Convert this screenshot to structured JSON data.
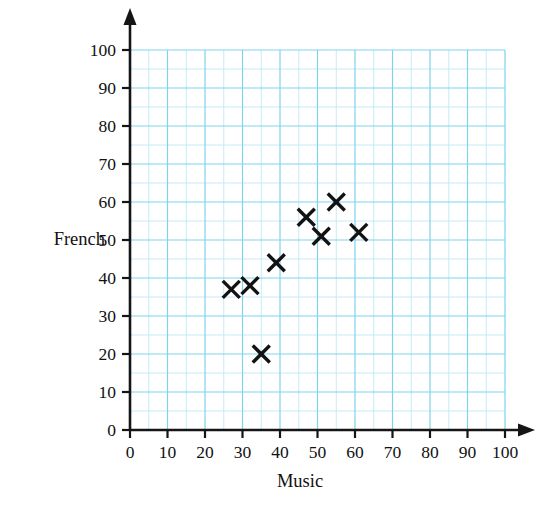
{
  "chart_data": {
    "type": "scatter",
    "title": "",
    "xlabel": "Music",
    "ylabel": "French",
    "xlim": [
      0,
      100
    ],
    "ylim": [
      0,
      100
    ],
    "xticks": [
      0,
      10,
      20,
      30,
      40,
      50,
      60,
      70,
      80,
      90,
      100
    ],
    "yticks": [
      0,
      10,
      20,
      30,
      40,
      50,
      60,
      70,
      80,
      90,
      100
    ],
    "xtick_labels": [
      "0",
      "10",
      "20",
      "30",
      "40",
      "50",
      "60",
      "70",
      "80",
      "90",
      "100"
    ],
    "ytick_labels": [
      "0",
      "10",
      "20",
      "30",
      "40",
      "50",
      "60",
      "70",
      "80",
      "90",
      "100"
    ],
    "grid": true,
    "grid_minor_step": 5,
    "grid_major_step": 10,
    "grid_color": "#bfe9f5",
    "grid_major_color": "#7fd4ec",
    "axis_color": "#151515",
    "marker": "x",
    "marker_color": "#121212",
    "legend": null,
    "points": [
      {
        "x": 27,
        "y": 37
      },
      {
        "x": 32,
        "y": 38
      },
      {
        "x": 35,
        "y": 20
      },
      {
        "x": 39,
        "y": 44
      },
      {
        "x": 47,
        "y": 56
      },
      {
        "x": 51,
        "y": 51
      },
      {
        "x": 55,
        "y": 60
      },
      {
        "x": 61,
        "y": 52
      }
    ]
  }
}
